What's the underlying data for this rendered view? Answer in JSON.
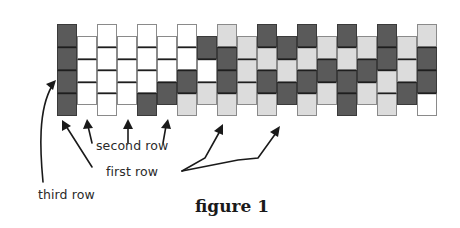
{
  "figure": {
    "caption": "figure 1",
    "labels": {
      "second_row": "second row",
      "first_row": "first row",
      "third_row": "third row"
    },
    "colors": {
      "dark": "#5a5a5a",
      "light": "#dcdcdc",
      "white": "#ffffff",
      "bead_border": "#8a8a8a",
      "inner_line": "#1e1e1e",
      "arrow": "#1a1a1a"
    },
    "grid": {
      "x0": 57,
      "col_width": 20,
      "bead_height": 23,
      "high_top": 24,
      "low_top": 36
    },
    "columns": [
      {
        "pos": "high",
        "beads": [
          "D",
          "D",
          "D",
          "D"
        ]
      },
      {
        "pos": "low",
        "beads": [
          "W",
          "W",
          "W"
        ]
      },
      {
        "pos": "high",
        "beads": [
          "W",
          "W",
          "W",
          "W"
        ]
      },
      {
        "pos": "low",
        "beads": [
          "W",
          "W",
          "W"
        ]
      },
      {
        "pos": "high",
        "beads": [
          "W",
          "W",
          "W",
          "D"
        ]
      },
      {
        "pos": "low",
        "beads": [
          "W",
          "W",
          "D"
        ]
      },
      {
        "pos": "high",
        "beads": [
          "W",
          "W",
          "D",
          "L"
        ]
      },
      {
        "pos": "low",
        "beads": [
          "D",
          "W",
          "L"
        ]
      },
      {
        "pos": "high",
        "beads": [
          "L",
          "D",
          "D",
          "L"
        ]
      },
      {
        "pos": "low",
        "beads": [
          "L",
          "L",
          "L"
        ]
      },
      {
        "pos": "high",
        "beads": [
          "D",
          "L",
          "D",
          "L"
        ]
      },
      {
        "pos": "low",
        "beads": [
          "D",
          "L",
          "D"
        ]
      },
      {
        "pos": "high",
        "beads": [
          "D",
          "L",
          "D",
          "L"
        ]
      },
      {
        "pos": "low",
        "beads": [
          "L",
          "D",
          "L"
        ]
      },
      {
        "pos": "high",
        "beads": [
          "D",
          "L",
          "D",
          "D"
        ]
      },
      {
        "pos": "low",
        "beads": [
          "L",
          "D",
          "L"
        ]
      },
      {
        "pos": "high",
        "beads": [
          "D",
          "D",
          "L",
          "L"
        ]
      },
      {
        "pos": "low",
        "beads": [
          "L",
          "L",
          "D"
        ]
      },
      {
        "pos": "high",
        "beads": [
          "L",
          "D",
          "D",
          "W"
        ]
      }
    ]
  }
}
